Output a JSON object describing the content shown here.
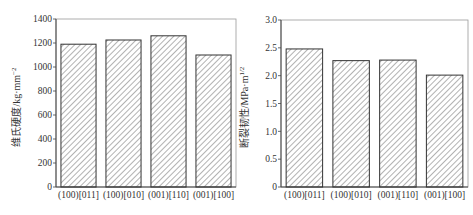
{
  "chart_data": [
    {
      "type": "bar",
      "title": "",
      "xlabel": "",
      "ylabel": "维氏硬度/kg·mm⁻²",
      "ylabel_main": "维氏硬度/kg·mm",
      "ylabel_sup": "−2",
      "categories": [
        "(100)[011]",
        "(100)[010]",
        "(001)[110]",
        "(001)[100]"
      ],
      "values": [
        1190,
        1225,
        1260,
        1100
      ],
      "ylim": [
        0,
        1400
      ],
      "yticks": [
        0,
        200,
        400,
        600,
        800,
        1000,
        1200,
        1400
      ],
      "grid": false,
      "legend": null,
      "hatch": "diagonal"
    },
    {
      "type": "bar",
      "title": "",
      "xlabel": "",
      "ylabel": "断裂韧性/MPa·m^1/2",
      "ylabel_main": "断裂韧性/MPa·m",
      "ylabel_sup": "1/2",
      "categories": [
        "(100)[011]",
        "(100)[010]",
        "(001)[110]",
        "(001)[100]"
      ],
      "values": [
        2.48,
        2.27,
        2.28,
        2.01
      ],
      "ylim": [
        0,
        3.0
      ],
      "yticks": [
        "0",
        "0.5",
        "1.0",
        "1.5",
        "2.0",
        "2.5",
        "3.0"
      ],
      "grid": false,
      "legend": null,
      "hatch": "diagonal"
    }
  ],
  "colors": {
    "axis": "#444444",
    "bar_edge": "#333333",
    "hatch": "#555555",
    "background": "#ffffff"
  }
}
